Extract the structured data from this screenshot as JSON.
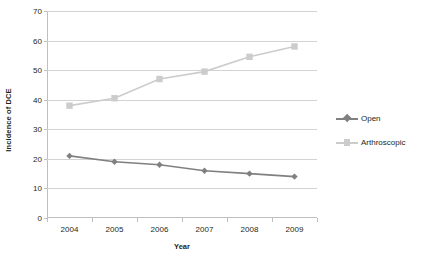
{
  "chart_data": {
    "type": "line",
    "title": "",
    "xlabel": "Year",
    "ylabel": "Incidence of DCE",
    "categories": [
      "2004",
      "2005",
      "2006",
      "2007",
      "2008",
      "2009"
    ],
    "ylim": [
      0,
      70
    ],
    "yticks": [
      0,
      10,
      20,
      30,
      40,
      50,
      60,
      70
    ],
    "grid": "horizontal",
    "legend_position": "right",
    "series": [
      {
        "name": "Open",
        "values": [
          21,
          19,
          18,
          16,
          15,
          14
        ],
        "color": "#808080",
        "marker": "diamond"
      },
      {
        "name": "Arthroscopic",
        "values": [
          38,
          40.5,
          47,
          49.5,
          54.5,
          58
        ],
        "color": "#cccccc",
        "marker": "square"
      }
    ]
  }
}
